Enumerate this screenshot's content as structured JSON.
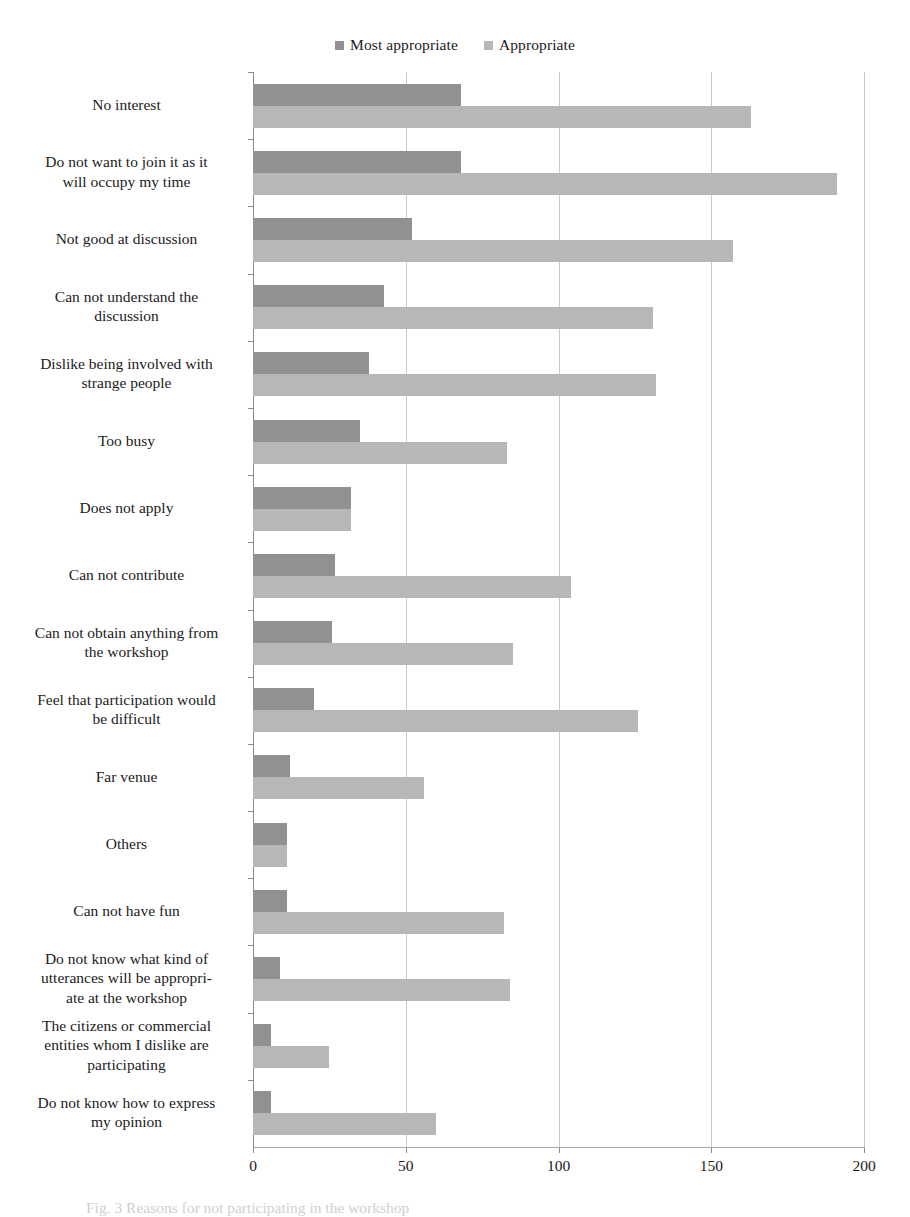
{
  "legend": {
    "entries": [
      {
        "label": "Most appropriate",
        "color": "#919191",
        "icon": "square-swatch-icon"
      },
      {
        "label": "Appropriate",
        "color": "#b7b7b7",
        "icon": "square-swatch-icon"
      }
    ]
  },
  "axis": {
    "x_ticks": [
      "0",
      "50",
      "100",
      "150",
      "200"
    ]
  },
  "caption": {
    "text": "Fig. 3  Reasons for not participating in the workshop"
  },
  "chart_data": {
    "type": "bar",
    "orientation": "horizontal",
    "title": "",
    "xlabel": "",
    "ylabel": "",
    "xlim": [
      0,
      200
    ],
    "x_ticks": [
      0,
      50,
      100,
      150,
      200
    ],
    "grid": "vertical",
    "legend_position": "top-center",
    "categories": [
      "No interest",
      "Do not want to join it as it will occupy my time",
      "Not good at discussion",
      "Can not understand the discussion",
      "Dislike being involved with strange people",
      "Too busy",
      "Does not apply",
      "Can not contribute",
      "Can not obtain anything from the workshop",
      "Feel that participation would be difficult",
      "Far venue",
      "Others",
      "Can not have fun",
      "Do not know what kind of utterances will be appropriate at the workshop",
      "The citizens or commercial entities whom I dislike are participating",
      "Do not know how to express my opinion"
    ],
    "category_lines": [
      [
        "No interest"
      ],
      [
        "Do not want to join it as it",
        "will occupy my time"
      ],
      [
        "Not good at discussion"
      ],
      [
        "Can not understand the",
        "discussion"
      ],
      [
        "Dislike being involved with",
        "strange people"
      ],
      [
        "Too busy"
      ],
      [
        "Does not apply"
      ],
      [
        "Can not contribute"
      ],
      [
        "Can not obtain anything from",
        "the workshop"
      ],
      [
        "Feel that participation would",
        "be difficult"
      ],
      [
        "Far venue"
      ],
      [
        "Others"
      ],
      [
        "Can not have fun"
      ],
      [
        "Do not know what kind of",
        "utterances will be appropri-",
        "ate at the workshop"
      ],
      [
        "The citizens or commercial",
        "entities whom I dislike are",
        "participating"
      ],
      [
        "Do not know how to express",
        "my opinion"
      ]
    ],
    "series": [
      {
        "name": "Most appropriate",
        "color": "#919191",
        "values": [
          68,
          68,
          52,
          43,
          38,
          35,
          32,
          27,
          26,
          20,
          12,
          11,
          11,
          9,
          6,
          6
        ]
      },
      {
        "name": "Appropriate",
        "color": "#b7b7b7",
        "values": [
          163,
          191,
          157,
          131,
          132,
          83,
          32,
          104,
          85,
          126,
          56,
          11,
          82,
          84,
          25,
          60
        ]
      }
    ]
  }
}
